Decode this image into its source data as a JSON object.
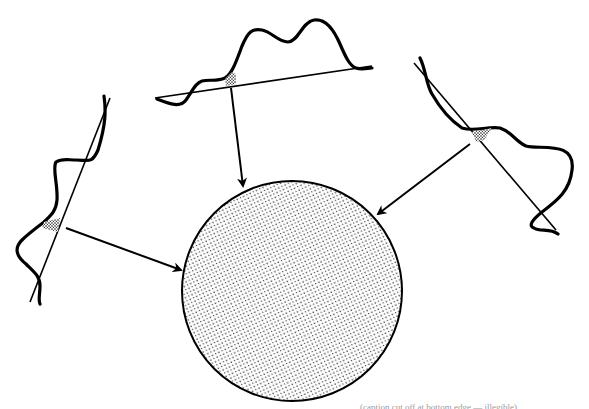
{
  "figure": {
    "colors": {
      "ink": "#000000",
      "background": "#ffffff",
      "stipple": "#1a1a1a",
      "caption": "#9a9a9a"
    },
    "disc": {
      "label": "stippled-disc",
      "center": [
        292,
        291
      ],
      "radius": 110
    },
    "profiles": [
      {
        "id": "top-profile",
        "position": "top",
        "baseline_from": [
          155,
          98
        ],
        "baseline_to": [
          372,
          66
        ]
      },
      {
        "id": "left-profile",
        "position": "left",
        "baseline_from": [
          30,
          302
        ],
        "baseline_to": [
          110,
          98
        ]
      },
      {
        "id": "right-profile",
        "position": "right",
        "baseline_from": [
          414,
          63
        ],
        "baseline_to": [
          556,
          230
        ]
      }
    ],
    "arrows": [
      {
        "id": "arrow-top",
        "from": [
          231,
          88
        ],
        "to": [
          244,
          188
        ]
      },
      {
        "id": "arrow-left",
        "from": [
          66,
          228
        ],
        "to": [
          182,
          270
        ]
      },
      {
        "id": "arrow-right",
        "from": [
          470,
          144
        ],
        "to": [
          378,
          214
        ]
      }
    ],
    "caption_text": "(caption cut off at bottom edge — illegible)"
  }
}
